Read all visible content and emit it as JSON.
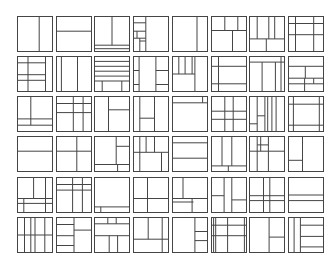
{
  "figure": {
    "rows": 6,
    "cols": 8,
    "line_color": "#454545",
    "background": "#ffffff"
  },
  "layout": {
    "col_x": [
      17,
      56,
      94,
      133,
      172,
      211,
      249,
      288
    ],
    "row_y": [
      16,
      56,
      96,
      136,
      177,
      217
    ],
    "cell_w": 36,
    "cell_h": 36
  },
  "cells": [
    [
      {
        "l": [
          [
            62,
            0,
            62,
            100
          ]
        ]
      },
      {
        "l": [
          [
            0,
            42,
            100,
            42
          ]
        ]
      },
      {
        "l": [
          [
            50,
            0,
            50,
            82
          ],
          [
            0,
            82,
            100,
            82
          ],
          [
            0,
            92,
            100,
            92
          ]
        ]
      },
      {
        "l": [
          [
            35,
            0,
            35,
            100
          ],
          [
            0,
            18,
            35,
            18
          ],
          [
            0,
            42,
            35,
            42
          ],
          [
            0,
            62,
            35,
            62
          ],
          [
            18,
            62,
            18,
            100
          ],
          [
            18,
            70,
            35,
            70
          ],
          [
            10,
            42,
            10,
            62
          ]
        ]
      },
      {
        "l": [
          [
            70,
            0,
            70,
            100
          ]
        ]
      },
      {
        "l": [
          [
            0,
            40,
            100,
            40
          ],
          [
            38,
            0,
            38,
            40
          ],
          [
            75,
            0,
            75,
            40
          ],
          [
            60,
            40,
            60,
            100
          ]
        ]
      },
      {
        "l": [
          [
            22,
            0,
            22,
            64
          ],
          [
            55,
            0,
            55,
            64
          ],
          [
            72,
            0,
            72,
            64
          ],
          [
            0,
            64,
            100,
            64
          ],
          [
            48,
            64,
            48,
            100
          ]
        ]
      },
      {
        "l": [
          [
            20,
            0,
            20,
            100
          ],
          [
            72,
            0,
            72,
            100
          ],
          [
            0,
            20,
            100,
            20
          ],
          [
            0,
            52,
            100,
            52
          ]
        ]
      }
    ],
    [
      {
        "l": [
          [
            80,
            0,
            80,
            100
          ],
          [
            0,
            18,
            80,
            18
          ],
          [
            0,
            52,
            80,
            52
          ],
          [
            0,
            68,
            80,
            68
          ],
          [
            30,
            0,
            30,
            100
          ]
        ]
      },
      {
        "l": [
          [
            14,
            0,
            14,
            100
          ],
          [
            60,
            0,
            60,
            100
          ]
        ]
      },
      {
        "l": [
          [
            0,
            14,
            100,
            14
          ],
          [
            0,
            28,
            100,
            28
          ],
          [
            0,
            42,
            100,
            42
          ],
          [
            0,
            56,
            100,
            56
          ],
          [
            0,
            70,
            100,
            70
          ],
          [
            22,
            70,
            22,
            100
          ],
          [
            78,
            70,
            78,
            100
          ]
        ]
      },
      {
        "l": [
          [
            16,
            0,
            16,
            100
          ],
          [
            0,
            40,
            16,
            40
          ],
          [
            0,
            80,
            16,
            80
          ],
          [
            64,
            0,
            64,
            100
          ],
          [
            64,
            40,
            100,
            40
          ],
          [
            64,
            80,
            100,
            80
          ]
        ]
      },
      {
        "l": [
          [
            18,
            0,
            18,
            50
          ],
          [
            36,
            0,
            36,
            50
          ],
          [
            56,
            0,
            56,
            50
          ],
          [
            0,
            50,
            64,
            50
          ],
          [
            64,
            0,
            64,
            100
          ]
        ]
      },
      {
        "l": [
          [
            20,
            0,
            20,
            100
          ],
          [
            0,
            28,
            100,
            28
          ],
          [
            0,
            78,
            100,
            78
          ]
        ]
      },
      {
        "l": [
          [
            0,
            16,
            100,
            16
          ],
          [
            36,
            16,
            36,
            100
          ],
          [
            74,
            16,
            74,
            100
          ],
          [
            90,
            0,
            90,
            100
          ]
        ]
      },
      {
        "l": [
          [
            0,
            28,
            100,
            28
          ],
          [
            0,
            62,
            100,
            62
          ],
          [
            48,
            28,
            48,
            62
          ],
          [
            46,
            62,
            46,
            100
          ],
          [
            72,
            62,
            72,
            78
          ],
          [
            0,
            78,
            100,
            78
          ]
        ]
      }
    ],
    [
      {
        "l": [
          [
            0,
            64,
            100,
            64
          ],
          [
            0,
            82,
            100,
            82
          ],
          [
            38,
            0,
            38,
            82
          ]
        ]
      },
      {
        "l": [
          [
            0,
            20,
            100,
            20
          ],
          [
            76,
            0,
            76,
            100
          ],
          [
            48,
            0,
            48,
            100
          ],
          [
            0,
            46,
            100,
            46
          ]
        ]
      },
      {
        "l": [
          [
            40,
            0,
            40,
            100
          ],
          [
            40,
            38,
            100,
            38
          ]
        ]
      },
      {
        "l": [
          [
            18,
            0,
            18,
            100
          ],
          [
            60,
            0,
            60,
            100
          ],
          [
            18,
            62,
            60,
            62
          ]
        ]
      },
      {
        "l": [
          [
            0,
            18,
            100,
            18
          ],
          [
            86,
            0,
            86,
            18
          ]
        ]
      },
      {
        "l": [
          [
            38,
            0,
            38,
            100
          ],
          [
            62,
            0,
            62,
            100
          ],
          [
            0,
            42,
            100,
            42
          ],
          [
            0,
            65,
            100,
            65
          ]
        ]
      },
      {
        "l": [
          [
            22,
            0,
            22,
            100
          ],
          [
            44,
            0,
            44,
            100
          ],
          [
            52,
            0,
            52,
            100
          ],
          [
            64,
            0,
            64,
            100
          ],
          [
            76,
            0,
            76,
            100
          ],
          [
            0,
            78,
            22,
            78
          ],
          [
            22,
            55,
            44,
            55
          ]
        ]
      },
      {
        "l": [
          [
            14,
            0,
            14,
            100
          ],
          [
            88,
            0,
            88,
            100
          ],
          [
            0,
            22,
            100,
            22
          ],
          [
            0,
            82,
            100,
            82
          ]
        ]
      }
    ],
    [
      {
        "l": [
          [
            0,
            42,
            100,
            42
          ]
        ]
      },
      {
        "l": [
          [
            0,
            42,
            100,
            42
          ],
          [
            58,
            0,
            58,
            100
          ]
        ]
      },
      {
        "l": [
          [
            62,
            0,
            62,
            80
          ],
          [
            62,
            28,
            100,
            28
          ],
          [
            0,
            80,
            100,
            80
          ],
          [
            66,
            80,
            66,
            100
          ]
        ]
      },
      {
        "l": [
          [
            18,
            0,
            18,
            100
          ],
          [
            36,
            0,
            36,
            45
          ],
          [
            60,
            0,
            60,
            45
          ],
          [
            0,
            45,
            100,
            45
          ],
          [
            80,
            45,
            80,
            100
          ]
        ]
      },
      {
        "l": [
          [
            0,
            18,
            100,
            18
          ],
          [
            0,
            62,
            100,
            62
          ]
        ]
      },
      {
        "l": [
          [
            30,
            0,
            30,
            84
          ],
          [
            58,
            0,
            58,
            84
          ],
          [
            0,
            84,
            100,
            84
          ],
          [
            48,
            84,
            48,
            100
          ]
        ]
      },
      {
        "l": [
          [
            0,
            42,
            100,
            42
          ],
          [
            22,
            0,
            22,
            100
          ],
          [
            54,
            0,
            54,
            42
          ],
          [
            32,
            0,
            32,
            42
          ],
          [
            22,
            24,
            54,
            24
          ],
          [
            54,
            42,
            54,
            100
          ]
        ]
      },
      {
        "l": [
          [
            40,
            0,
            40,
            100
          ],
          [
            0,
            68,
            40,
            68
          ]
        ]
      }
    ],
    [
      {
        "l": [
          [
            46,
            0,
            46,
            60
          ],
          [
            80,
            0,
            80,
            100
          ],
          [
            0,
            60,
            100,
            60
          ],
          [
            0,
            74,
            100,
            74
          ],
          [
            18,
            60,
            18,
            100
          ]
        ]
      },
      {
        "l": [
          [
            0,
            20,
            100,
            20
          ],
          [
            0,
            36,
            100,
            36
          ],
          [
            46,
            0,
            46,
            100
          ],
          [
            74,
            0,
            74,
            100
          ]
        ]
      },
      {
        "l": [
          [
            0,
            84,
            100,
            84
          ],
          [
            18,
            84,
            18,
            100
          ]
        ]
      },
      {
        "l": [
          [
            40,
            0,
            40,
            100
          ],
          [
            0,
            60,
            100,
            60
          ]
        ]
      },
      {
        "l": [
          [
            30,
            0,
            30,
            60
          ],
          [
            0,
            60,
            100,
            60
          ],
          [
            0,
            70,
            60,
            70
          ],
          [
            56,
            60,
            56,
            100
          ]
        ]
      },
      {
        "l": [
          [
            36,
            0,
            36,
            100
          ],
          [
            58,
            0,
            58,
            100
          ],
          [
            0,
            52,
            36,
            52
          ],
          [
            58,
            64,
            100,
            64
          ]
        ]
      },
      {
        "l": [
          [
            40,
            0,
            40,
            100
          ],
          [
            58,
            0,
            58,
            100
          ],
          [
            0,
            52,
            100,
            52
          ],
          [
            0,
            66,
            100,
            66
          ]
        ]
      },
      {
        "l": [
          [
            0,
            50,
            100,
            50
          ],
          [
            0,
            66,
            100,
            66
          ]
        ]
      }
    ],
    [
      {
        "l": [
          [
            20,
            0,
            20,
            100
          ],
          [
            38,
            0,
            38,
            100
          ],
          [
            50,
            0,
            50,
            100
          ],
          [
            78,
            0,
            78,
            100
          ],
          [
            0,
            50,
            100,
            50
          ]
        ]
      },
      {
        "l": [
          [
            0,
            20,
            50,
            20
          ],
          [
            50,
            0,
            50,
            100
          ],
          [
            50,
            36,
            100,
            36
          ],
          [
            0,
            80,
            50,
            80
          ],
          [
            0,
            52,
            50,
            52
          ]
        ]
      },
      {
        "l": [
          [
            0,
            18,
            100,
            18
          ],
          [
            38,
            0,
            38,
            18
          ],
          [
            62,
            0,
            62,
            18
          ],
          [
            0,
            52,
            100,
            52
          ],
          [
            42,
            52,
            42,
            100
          ],
          [
            66,
            52,
            66,
            100
          ]
        ]
      },
      {
        "l": [
          [
            42,
            0,
            42,
            62
          ],
          [
            82,
            0,
            82,
            100
          ],
          [
            0,
            62,
            100,
            62
          ]
        ]
      },
      {
        "l": [
          [
            64,
            0,
            64,
            100
          ],
          [
            64,
            40,
            100,
            40
          ],
          [
            64,
            66,
            100,
            66
          ]
        ]
      },
      {
        "l": [
          [
            6,
            0,
            6,
            100
          ],
          [
            12,
            0,
            12,
            100
          ],
          [
            46,
            0,
            46,
            100
          ],
          [
            94,
            0,
            94,
            100
          ],
          [
            0,
            22,
            100,
            22
          ],
          [
            0,
            52,
            100,
            52
          ]
        ]
      },
      {
        "l": [
          [
            56,
            0,
            56,
            100
          ],
          [
            56,
            56,
            100,
            56
          ]
        ]
      },
      {
        "l": [
          [
            16,
            0,
            16,
            100
          ],
          [
            34,
            0,
            34,
            100
          ],
          [
            34,
            22,
            100,
            22
          ],
          [
            34,
            54,
            100,
            54
          ],
          [
            34,
            84,
            100,
            84
          ]
        ]
      }
    ]
  ]
}
